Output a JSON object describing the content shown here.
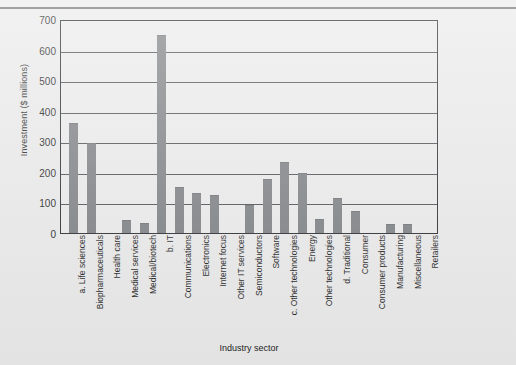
{
  "figure": {
    "ylabel": "Investment ($ millions)",
    "xlabel": "Industry sector"
  },
  "chart_data": {
    "type": "bar",
    "title": "",
    "xlabel": "Industry sector",
    "ylabel": "Investment ($ millions)",
    "ylim": [
      0,
      700
    ],
    "yticks": [
      0,
      100,
      200,
      300,
      400,
      500,
      600,
      700
    ],
    "grid": true,
    "legend": "none",
    "bar_color": "#7c7f82",
    "categories": [
      "a. Life sciences",
      "Biopharmaceuticals",
      "Health care",
      "Medical services",
      "Medical/biotech",
      "b. IT",
      "Communications",
      "Electronics",
      "Internet focus",
      "Other IT services",
      "Semiconductors",
      "Software",
      "c. Other technologies",
      "Energy",
      "Other technologies",
      "d. Traditional",
      "Consumer",
      "Consumer products",
      "Manufacturing",
      "Miscellaneous",
      "Retailers"
    ],
    "values": [
      358,
      290,
      0,
      40,
      28,
      643,
      148,
      126,
      122,
      0,
      88,
      172,
      228,
      192,
      43,
      112,
      70,
      0,
      25,
      26,
      0
    ]
  }
}
